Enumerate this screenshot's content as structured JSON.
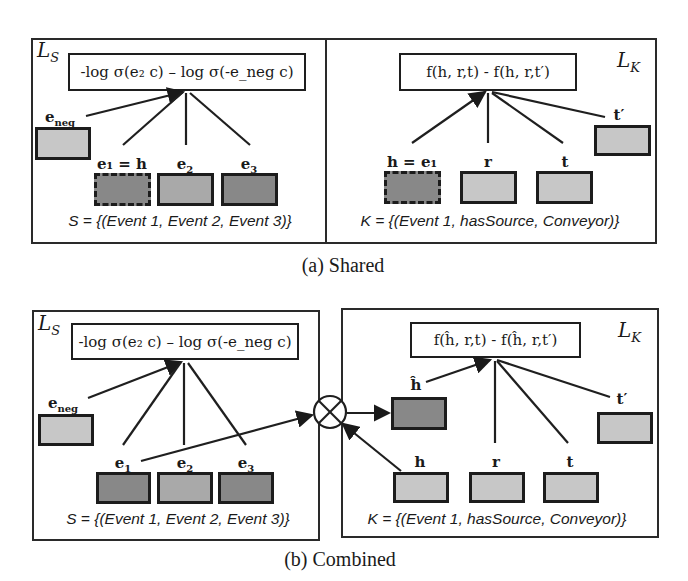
{
  "shared": {
    "caption": "(a) Shared",
    "left": {
      "loss_label": "L",
      "loss_sub": "S",
      "formula": "-log σ(e₂ c) – log σ(-e_neg c)",
      "nodes": {
        "e_neg": "e",
        "e_neg_sub": "neg",
        "e1": "e₁ = h",
        "e2": "e",
        "e2_sub": "2",
        "e3": "e",
        "e3_sub": "3"
      },
      "set": "S = {(Event 1, Event 2, Event 3)}"
    },
    "right": {
      "loss_label": "L",
      "loss_sub": "K",
      "formula": "f(h, r,t) - f(h, r,t′)",
      "nodes": {
        "h": "h = e₁",
        "r": "r",
        "t": "t",
        "t_prime": "t′"
      },
      "set": "K = {(Event 1, hasSource, Conveyor)}"
    }
  },
  "combined": {
    "caption": "(b) Combined",
    "left": {
      "loss_label": "L",
      "loss_sub": "S",
      "formula": "-log σ(e₂ c) – log σ(-e_neg c)",
      "nodes": {
        "e_neg": "e",
        "e_neg_sub": "neg",
        "e1": "e",
        "e1_sub": "1",
        "e2": "e",
        "e2_sub": "2",
        "e3": "e",
        "e3_sub": "3"
      },
      "set": "S = {(Event 1, Event 2, Event 3)}"
    },
    "right": {
      "loss_label": "L",
      "loss_sub": "K",
      "formula": "f(ĥ, r,t) - f(ĥ, r,t′)",
      "nodes": {
        "h_hat": "ĥ",
        "h": "h",
        "r": "r",
        "t": "t",
        "t_prime": "t′"
      },
      "set": "K = {(Event 1, hasSource, Conveyor)}"
    },
    "combine_op": "⊗"
  }
}
